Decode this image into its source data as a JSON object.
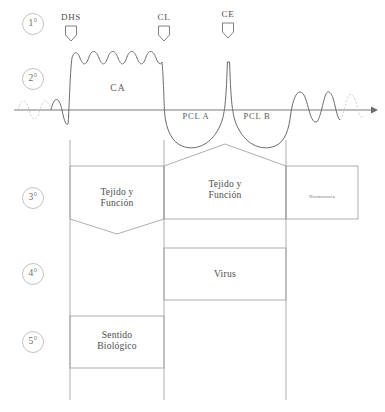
{
  "diagram": {
    "phase_markers": [
      {
        "id": "p1",
        "label": "1°",
        "cx": 33,
        "cy": 24
      },
      {
        "id": "p2",
        "label": "2°",
        "cx": 33,
        "cy": 79
      },
      {
        "id": "p3",
        "label": "3°",
        "cx": 33,
        "cy": 198
      },
      {
        "id": "p4",
        "label": "4°",
        "cx": 33,
        "cy": 274
      },
      {
        "id": "p5",
        "label": "5°",
        "cx": 33,
        "cy": 342
      }
    ],
    "event_markers": [
      {
        "id": "dhs",
        "label": "DHS",
        "x": 71,
        "label_y": 12,
        "flag_y": 26
      },
      {
        "id": "cl",
        "label": "CL",
        "x": 164,
        "label_y": 12,
        "flag_y": 26
      },
      {
        "id": "ce",
        "label": "CE",
        "x": 228,
        "label_y": 9,
        "flag_y": 23
      }
    ],
    "curve_labels": [
      {
        "id": "ca",
        "label": "CA",
        "x": 118,
        "y": 89,
        "cls": "lbl-ca"
      },
      {
        "id": "pcl_a",
        "label": "PCL A",
        "x": 196,
        "y": 117,
        "cls": "lbl-pcl"
      },
      {
        "id": "pcl_b",
        "label": "PCL B",
        "x": 257,
        "y": 117,
        "cls": "lbl-pcl"
      }
    ],
    "boxes": [
      {
        "id": "tejido-funcion-left",
        "label": "Tejido y\nFunción",
        "cx": 117,
        "cy": 198,
        "cls": "lbl-box"
      },
      {
        "id": "tejido-funcion-right",
        "label": "Tejido y\nFunción",
        "cx": 225,
        "cy": 190,
        "cls": "lbl-box"
      },
      {
        "id": "normotonia",
        "label": "Normotonia",
        "cx": 322,
        "cy": 197,
        "cls": "lbl-small"
      },
      {
        "id": "virus",
        "label": "Virus",
        "cx": 225,
        "cy": 274,
        "cls": "lbl-virus"
      },
      {
        "id": "sentido-biologico",
        "label": "Sentido\nBiológico",
        "cx": 117,
        "cy": 341,
        "cls": "lbl-box"
      }
    ],
    "colors": {
      "stroke": "#6b6b6e",
      "stroke_light": "#a9a9ad",
      "stroke_faint": "#c9c9ce",
      "text": "#4d4d4f",
      "background": "#ffffff"
    },
    "geometry": {
      "baseline_y": 110,
      "axis_x_start": 14,
      "axis_x_end": 375,
      "vertical_lines_x": [
        70,
        164,
        286
      ],
      "column_mid_x": 225
    }
  }
}
